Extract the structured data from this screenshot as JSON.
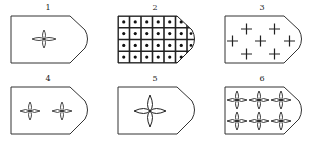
{
  "figure": {
    "panels": [
      {
        "label": "1",
        "pattern": "single-four-point-star",
        "count": 1
      },
      {
        "label": "2",
        "pattern": "grid-of-dotted-squares",
        "count": 24
      },
      {
        "label": "3",
        "pattern": "scattered-plus-signs",
        "count": 7
      },
      {
        "label": "4",
        "pattern": "two-four-point-stars",
        "count": 2
      },
      {
        "label": "5",
        "pattern": "single-large-four-point-star",
        "count": 1
      },
      {
        "label": "6",
        "pattern": "six-four-point-stars",
        "count": 6
      }
    ],
    "caption": "",
    "colors": {
      "stroke": "#333333",
      "background": "#ffffff"
    }
  }
}
